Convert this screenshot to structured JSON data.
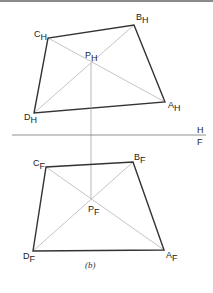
{
  "figure": {
    "caption": "(b)",
    "colors": {
      "outline": "#333333",
      "construction": "#b5b5b5",
      "folding_line": "#777777",
      "text": "#222222",
      "top_border": "#8a8a8a"
    },
    "folding_line": {
      "label_above": "H",
      "label_below": "F",
      "y": 135,
      "x1": 12,
      "x2": 206
    },
    "projector": {
      "x": 91,
      "y1": 63,
      "y2": 199
    },
    "views": [
      {
        "id": "H",
        "points": {
          "A": {
            "label": "A",
            "sub": "H",
            "x": 165,
            "y": 102
          },
          "B": {
            "label": "B",
            "sub": "H",
            "x": 134,
            "y": 25
          },
          "C": {
            "label": "C",
            "sub": "H",
            "x": 48,
            "y": 38
          },
          "D": {
            "label": "D",
            "sub": "H",
            "x": 34,
            "y": 113
          },
          "P": {
            "label": "P",
            "sub": "H",
            "x": 91,
            "y": 63
          }
        }
      },
      {
        "id": "F",
        "points": {
          "A": {
            "label": "A",
            "sub": "F",
            "x": 164,
            "y": 250
          },
          "B": {
            "label": "B",
            "sub": "F",
            "x": 133,
            "y": 162
          },
          "C": {
            "label": "C",
            "sub": "F",
            "x": 46,
            "y": 167
          },
          "D": {
            "label": "D",
            "sub": "F",
            "x": 33,
            "y": 251
          },
          "P": {
            "label": "P",
            "sub": "F",
            "x": 91,
            "y": 199
          }
        }
      }
    ]
  }
}
